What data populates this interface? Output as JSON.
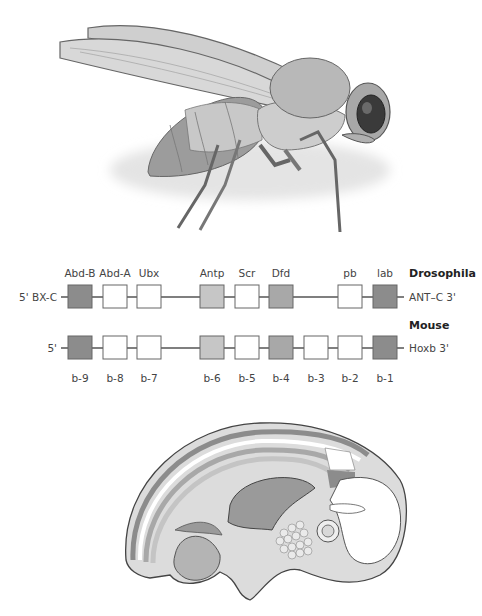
{
  "fly": {
    "label": "Drosophila illustration"
  },
  "embryo": {
    "label": "Mouse embryo illustration"
  },
  "gene_map": {
    "drosophila": {
      "title": "Drosophila",
      "left_label": "5' BX-C",
      "right_label": "ANT–C 3'",
      "genes": [
        {
          "name": "Abd-B",
          "x": 68,
          "shade": "dark"
        },
        {
          "name": "Abd-A",
          "x": 103,
          "shade": "white"
        },
        {
          "name": "Ubx",
          "x": 137,
          "shade": "white"
        },
        {
          "name": "Antp",
          "x": 200,
          "shade": "light"
        },
        {
          "name": "Scr",
          "x": 235,
          "shade": "white"
        },
        {
          "name": "Dfd",
          "x": 269,
          "shade": "medium"
        },
        {
          "name": "pb",
          "x": 338,
          "shade": "white"
        },
        {
          "name": "lab",
          "x": 373,
          "shade": "dark"
        }
      ]
    },
    "mouse": {
      "title": "Mouse",
      "left_label": "5'",
      "right_label": "Hoxb 3'",
      "genes": [
        {
          "name": "b-9",
          "x": 68,
          "shade": "dark"
        },
        {
          "name": "b-8",
          "x": 103,
          "shade": "white"
        },
        {
          "name": "b-7",
          "x": 137,
          "shade": "white"
        },
        {
          "name": "b-6",
          "x": 200,
          "shade": "light"
        },
        {
          "name": "b-5",
          "x": 235,
          "shade": "white"
        },
        {
          "name": "b-4",
          "x": 269,
          "shade": "medium"
        },
        {
          "name": "b-3",
          "x": 304,
          "shade": "white"
        },
        {
          "name": "b-2",
          "x": 338,
          "shade": "white"
        },
        {
          "name": "b-1",
          "x": 373,
          "shade": "dark"
        }
      ]
    },
    "colors": {
      "dark": "#8c8c8c",
      "medium": "#a8a8a8",
      "light": "#c6c6c6",
      "white": "#ffffff",
      "stroke": "#666666",
      "line": "#555555"
    }
  }
}
